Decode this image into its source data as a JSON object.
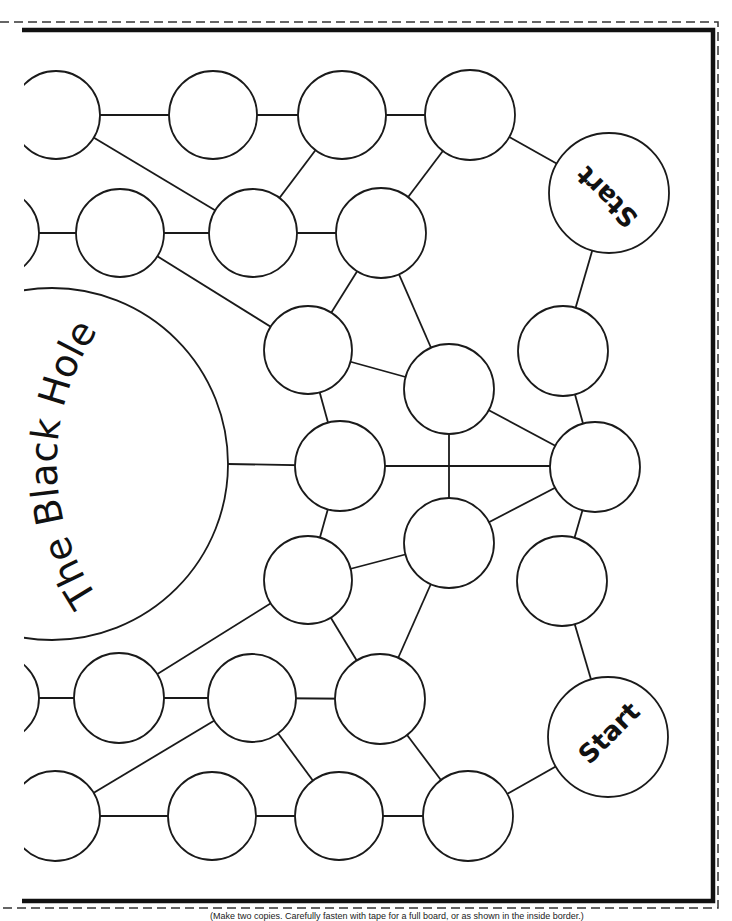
{
  "board": {
    "black_hole": {
      "label": "The Black Hole"
    },
    "start_spaces": [
      {
        "id": "start-top",
        "label": "Start"
      },
      {
        "id": "start-bottom",
        "label": "Start"
      }
    ],
    "space_count": 31,
    "colors": {
      "line": "#1a1a1a",
      "background": "#ffffff"
    }
  },
  "footer": {
    "note": "(Make two copies. Carefully fasten with tape for a full board, or as shown in the inside border.)"
  }
}
